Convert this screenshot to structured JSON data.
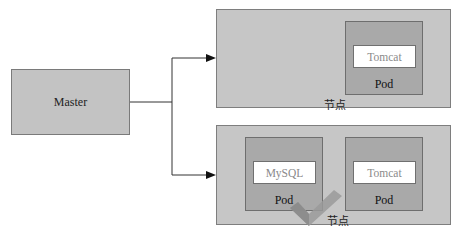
{
  "master": {
    "label": "Master"
  },
  "nodes": [
    {
      "label": "节点",
      "pods": [
        {
          "label": "Pod",
          "container": "Tomcat"
        }
      ]
    },
    {
      "label": "节点",
      "pods": [
        {
          "label": "Pod",
          "container": "MySQL"
        },
        {
          "label": "Pod",
          "container": "Tomcat"
        }
      ]
    }
  ],
  "colors": {
    "node_fill": "#c6c6c6",
    "pod_fill": "#a9a9a9",
    "container_fill": "#ffffff",
    "checkmark": "#9a9a9a"
  }
}
